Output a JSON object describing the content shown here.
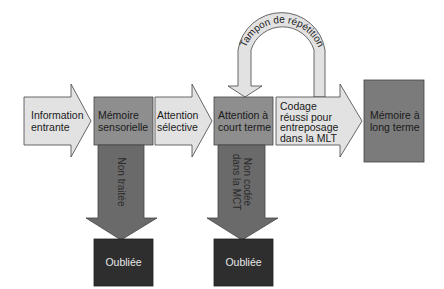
{
  "diagram": {
    "type": "flowchart",
    "colors": {
      "arrow_light": "#e2e2e2",
      "box_mid": "#8e8e8e",
      "box_dark_mlt": "#7b7b7b",
      "arrow_down": "#6a6a6a",
      "box_forgotten": "#2e2e2e",
      "stroke": "#444444"
    },
    "nodes": {
      "information_entrante": "Information\nentrante",
      "memoire_sensorielle": "Mémoire\nsensorielle",
      "attention_selective": "Attention\nsélective",
      "attention_court_terme": "Attention à\ncourt terme",
      "codage": "Codage\nréussi pour\nentreposage\ndans la MLT",
      "memoire_long_terme": "Mémoire à\nlong terme",
      "oubliee_1": "Oubliée",
      "oubliee_2": "Oubliée"
    },
    "edges": {
      "non_traitee": "Non traitée",
      "non_codee": "Non codée\ndans la MCT",
      "tampon": "Tampon de répétition"
    }
  }
}
